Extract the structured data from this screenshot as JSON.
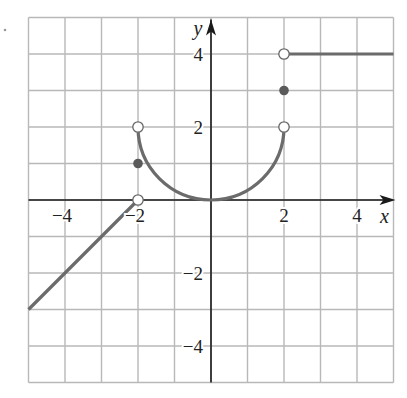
{
  "chart_data": {
    "type": "line",
    "title": "",
    "xlabel": "x",
    "ylabel": "y",
    "xlim": [
      -5,
      5
    ],
    "ylim": [
      -5,
      5
    ],
    "grid": true,
    "grid_step": 1,
    "x_ticks": [
      -4,
      -2,
      2,
      4
    ],
    "y_ticks": [
      4,
      2,
      -2,
      -4
    ],
    "x_tick_labels": [
      "−4",
      "−2",
      "2",
      "4"
    ],
    "y_tick_labels": [
      "4",
      "2",
      "−2",
      "−4"
    ],
    "series": [
      {
        "name": "linear-segment",
        "kind": "line",
        "points": [
          [
            -5,
            -3
          ],
          [
            -2,
            0
          ]
        ],
        "right_endpoint": "open"
      },
      {
        "name": "semicircle-arc",
        "kind": "curve",
        "description": "lower half of circle centered (0,2) radius 2",
        "from": [
          -2,
          2
        ],
        "to": [
          2,
          2
        ],
        "bottom": [
          0,
          0
        ],
        "endpoints": "open"
      },
      {
        "name": "constant-segment",
        "kind": "line",
        "points": [
          [
            2,
            4
          ],
          [
            5,
            4
          ]
        ],
        "left_endpoint": "open"
      }
    ],
    "open_points": [
      [
        -2,
        0
      ],
      [
        -2,
        2
      ],
      [
        2,
        2
      ],
      [
        2,
        4
      ]
    ],
    "closed_points": [
      [
        -2,
        1
      ],
      [
        2,
        3
      ]
    ],
    "colors": {
      "curve": "#6b6b6b",
      "grid": "#b8b8b8",
      "axis": "#1a1a1a",
      "dot": "#5a5a5a"
    }
  }
}
